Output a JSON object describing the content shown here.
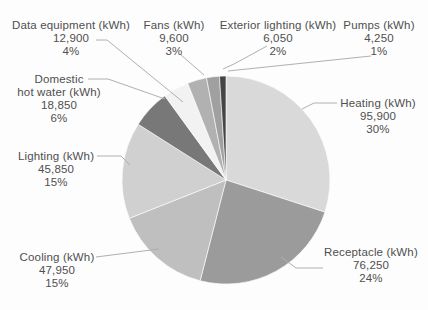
{
  "chart_data": {
    "type": "pie",
    "title": "",
    "unit": "kWh",
    "direction": "clockwise",
    "start_angle_deg": 0,
    "legend_position": "callout-labels",
    "slices": [
      {
        "id": "heating",
        "label_lines": [
          "Heating (kWh)"
        ],
        "value": 95900,
        "value_text": "95,900",
        "pct": 30,
        "pct_text": "30%",
        "color": "#d9d9d9"
      },
      {
        "id": "receptacle",
        "label_lines": [
          "Receptacle (kWh)"
        ],
        "value": 76250,
        "value_text": "76,250",
        "pct": 24,
        "pct_text": "24%",
        "color": "#9b9b9b"
      },
      {
        "id": "cooling",
        "label_lines": [
          "Cooling (kWh)"
        ],
        "value": 47950,
        "value_text": "47,950",
        "pct": 15,
        "pct_text": "15%",
        "color": "#bfbfbf"
      },
      {
        "id": "lighting",
        "label_lines": [
          "Lighting (kWh)"
        ],
        "value": 45850,
        "value_text": "45,850",
        "pct": 15,
        "pct_text": "15%",
        "color": "#d0d0d0"
      },
      {
        "id": "domestic-hot-water",
        "label_lines": [
          "Domestic",
          "hot water (kWh)"
        ],
        "value": 18850,
        "value_text": "18,850",
        "pct": 6,
        "pct_text": "6%",
        "color": "#787878"
      },
      {
        "id": "data-equipment",
        "label_lines": [
          "Data equipment (kWh)"
        ],
        "value": 12900,
        "value_text": "12,900",
        "pct": 4,
        "pct_text": "4%",
        "color": "#f2f2f2"
      },
      {
        "id": "fans",
        "label_lines": [
          "Fans (kWh)"
        ],
        "value": 9600,
        "value_text": "9,600",
        "pct": 3,
        "pct_text": "3%",
        "color": "#b1b1b1"
      },
      {
        "id": "exterior-lighting",
        "label_lines": [
          "Exterior lighting (kWh)"
        ],
        "value": 6050,
        "value_text": "6,050",
        "pct": 2,
        "pct_text": "2%",
        "color": "#a0a0a0"
      },
      {
        "id": "pumps",
        "label_lines": [
          "Pumps (kWh)"
        ],
        "value": 4250,
        "value_text": "4,250",
        "pct": 1,
        "pct_text": "1%",
        "color": "#454545"
      }
    ],
    "colors": {
      "label_text": "#4f4f4f",
      "leader_line": "#b0b0b0",
      "slice_border": "#ffffff",
      "background": "#fdfdfd"
    }
  }
}
